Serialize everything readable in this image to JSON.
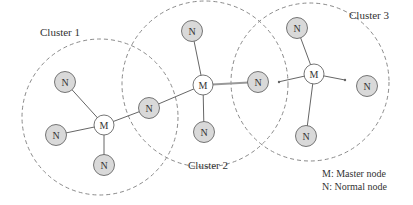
{
  "clusters": [
    {
      "label": "Cluster 1",
      "cx": 100,
      "cy": 117,
      "r": 78,
      "label_x": 40,
      "label_y": 36
    },
    {
      "label": "Cluster 2",
      "cx": 205,
      "cy": 84,
      "r": 83,
      "label_x": 188,
      "label_y": 169
    },
    {
      "label": "Cluster 3",
      "cx": 310,
      "cy": 82,
      "r": 79,
      "label_x": 349,
      "label_y": 19
    }
  ],
  "nodes": [
    {
      "id": "m1",
      "type": "M",
      "label": "M",
      "x": 104,
      "y": 125
    },
    {
      "id": "n1a",
      "type": "N",
      "label": "N",
      "x": 65,
      "y": 82
    },
    {
      "id": "n1b",
      "type": "N",
      "label": "N",
      "x": 56,
      "y": 135
    },
    {
      "id": "n1c",
      "type": "N",
      "label": "N",
      "x": 104,
      "y": 165
    },
    {
      "id": "n12",
      "type": "N",
      "label": "N",
      "x": 149,
      "y": 108
    },
    {
      "id": "m2",
      "type": "M",
      "label": "M",
      "x": 203,
      "y": 85
    },
    {
      "id": "n2a",
      "type": "N",
      "label": "N",
      "x": 192,
      "y": 31
    },
    {
      "id": "n2b",
      "type": "N",
      "label": "N",
      "x": 204,
      "y": 132
    },
    {
      "id": "n23",
      "type": "N",
      "label": "N",
      "x": 258,
      "y": 82
    },
    {
      "id": "m3",
      "type": "M",
      "label": "M",
      "x": 314,
      "y": 74
    },
    {
      "id": "n3a",
      "type": "N",
      "label": "N",
      "x": 297,
      "y": 28
    },
    {
      "id": "n3b",
      "type": "N",
      "label": "N",
      "x": 306,
      "y": 136
    },
    {
      "id": "n3c",
      "type": "N",
      "label": "N",
      "x": 367,
      "y": 86
    }
  ],
  "legend": {
    "line1": "M: Master node",
    "line2": "N: Normal node"
  },
  "colors": {
    "normal_fill": "#d9d9d9",
    "master_fill": "#ffffff",
    "stroke": "#666666",
    "dash": "#888888"
  }
}
